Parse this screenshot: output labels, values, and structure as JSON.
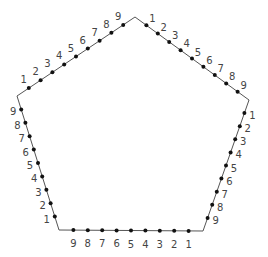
{
  "diagram": {
    "type": "pentagon-with-division-points",
    "width": 268,
    "height": 257,
    "line_color": "#555555",
    "point_color": "#111111",
    "label_color": "#444444",
    "vertices": {
      "top": [
        135,
        17
      ],
      "right": [
        249,
        100
      ],
      "bottom_right": [
        203,
        231
      ],
      "bottom_left": [
        59,
        230
      ],
      "left": [
        17,
        96
      ]
    },
    "edges": [
      {
        "name": "top-left-edge",
        "from": "left",
        "to": "top",
        "labels": [
          "1",
          "2",
          "3",
          "4",
          "5",
          "6",
          "7",
          "8",
          "9"
        ],
        "label_offset": [
          -5,
          -8
        ]
      },
      {
        "name": "top-right-edge",
        "from": "top",
        "to": "right",
        "labels": [
          "1",
          "2",
          "3",
          "4",
          "5",
          "6",
          "7",
          "8",
          "9"
        ],
        "label_offset": [
          6,
          -6
        ]
      },
      {
        "name": "right-edge",
        "from": "right",
        "to": "bottom_right",
        "labels": [
          "1",
          "2",
          "3",
          "4",
          "5",
          "6",
          "7",
          "8",
          "9"
        ],
        "label_offset": [
          8,
          3
        ]
      },
      {
        "name": "bottom-edge",
        "from": "bottom_right",
        "to": "bottom_left",
        "labels": [
          "1",
          "2",
          "3",
          "4",
          "5",
          "6",
          "7",
          "8",
          "9"
        ],
        "label_offset": [
          0,
          14
        ]
      },
      {
        "name": "left-edge",
        "from": "bottom_left",
        "to": "left",
        "labels": [
          "1",
          "2",
          "3",
          "4",
          "5",
          "6",
          "7",
          "8",
          "9"
        ],
        "label_offset": [
          -8,
          3
        ]
      }
    ]
  }
}
